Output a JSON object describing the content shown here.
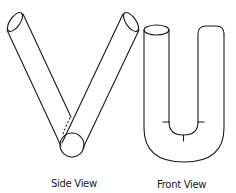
{
  "figure": {
    "views": [
      {
        "id": "side",
        "label": "Side View",
        "shape": "V-shaped pair of cylinders meeting at a circular base"
      },
      {
        "id": "front",
        "label": "Front View",
        "shape": "U-shaped tube with open cylinder end and rounded closed end"
      }
    ],
    "colors": {
      "line": "#1a1a1a",
      "background": "#ffffff"
    }
  }
}
